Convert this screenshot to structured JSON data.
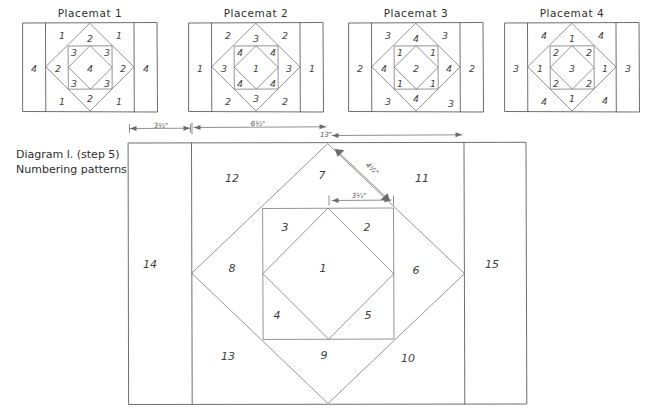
{
  "document": {
    "title": "Diagram 1. (step 5) Numbering patterns",
    "caption_line1": "Diagram l. (step 5)",
    "caption_line2": "Numbering patterns",
    "ink_color": "#5d5d5d",
    "paper_color": "#ffffff"
  },
  "placemats": [
    {
      "title": "Placemat 1",
      "left_band": "4",
      "right_band": "4",
      "corner_tl": "1",
      "corner_tr": "1",
      "corner_bl": "1",
      "corner_br": "1",
      "diamond_top": "2",
      "diamond_bottom": "2",
      "diamond_left": "2",
      "diamond_right": "2",
      "inner_tl": "3",
      "inner_tr": "3",
      "inner_bl": "3",
      "inner_br": "3",
      "center": "4"
    },
    {
      "title": "Placemat 2",
      "left_band": "1",
      "right_band": "1",
      "corner_tl": "2",
      "corner_tr": "2",
      "corner_bl": "2",
      "corner_br": "2",
      "diamond_top": "3",
      "diamond_bottom": "3",
      "diamond_left": "3",
      "diamond_right": "3",
      "inner_tl": "4",
      "inner_tr": "4",
      "inner_bl": "4",
      "inner_br": "4",
      "center": "1"
    },
    {
      "title": "Placemat 3",
      "left_band": "2",
      "right_band": "2",
      "corner_tl": "3",
      "corner_tr": "3",
      "corner_bl": "3",
      "corner_br": "3",
      "diamond_top": "4",
      "diamond_bottom": "4",
      "diamond_left": "4",
      "diamond_right": "4",
      "inner_tl": "1",
      "inner_tr": "1",
      "inner_bl": "1",
      "inner_br": "1",
      "center": "2"
    },
    {
      "title": "Placemat 4",
      "left_band": "3",
      "right_band": "3",
      "corner_tl": "4",
      "corner_tr": "4",
      "corner_bl": "4",
      "corner_br": "4",
      "diamond_top": "1",
      "diamond_bottom": "1",
      "diamond_left": "1",
      "diamond_right": "1",
      "inner_tl": "2",
      "inner_tr": "2",
      "inner_bl": "2",
      "inner_br": "2",
      "center": "3"
    }
  ],
  "main_diagram": {
    "center": "1",
    "inner_tr": "2",
    "inner_tl": "3",
    "inner_bl": "4",
    "inner_br": "5",
    "tri_right": "6",
    "tri_top": "7",
    "tri_left": "8",
    "tri_bottom": "9",
    "corner_br": "10",
    "corner_tr": "11",
    "corner_tl": "12",
    "corner_bl": "13",
    "band_left": "14",
    "band_right": "15"
  },
  "dimensions": {
    "left_band_width": "3½\"",
    "panel_width": "6½\"",
    "total_width": "13\"",
    "diagonal": "4½\"",
    "inner_half": "3¼\""
  }
}
